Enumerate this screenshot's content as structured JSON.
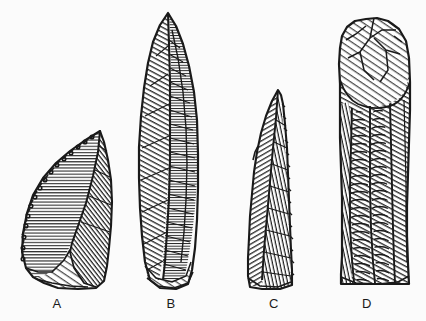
{
  "plate": {
    "title": "Stone tool plate",
    "description": "Black-and-white ink line drawing of four flaked stone artifacts shown in vertical orientation on a plain white ground, each labelled with a capital letter beneath it.",
    "background_color": "#fbfbfb",
    "ink_color": "#1a1a1a",
    "width": 426,
    "height": 321
  },
  "figures": [
    {
      "id": "a",
      "label": "A",
      "name": "backed-blade-fragment",
      "description": "Short triangular backed piece with a steeply retouched, denticulated left margin, horizontal hatching on the upper-left facet and oblique hatching on the right facet, truncated base.",
      "label_x": 55,
      "label_y": 303,
      "bounds": {
        "x": 21,
        "y": 128,
        "width": 92,
        "height": 161
      }
    },
    {
      "id": "b",
      "label": "B",
      "name": "elongated-laurel-leaf-point",
      "description": "Long leaf-shaped bifacial point with a sharp apex at the top, a central arris running the full length, and dense herringbone flake-scar hatching on both faces; broad straight base.",
      "label_x": 169,
      "label_y": 303,
      "bounds": {
        "x": 137,
        "y": 12,
        "width": 68,
        "height": 277
      }
    },
    {
      "id": "c",
      "label": "C",
      "name": "narrow-shouldered-point",
      "description": "Slender elongated point with a needle-like tip at the top, a slight shoulder on the left margin, fine parallel oblique hatching across the body and a narrow flat base.",
      "label_x": 272,
      "label_y": 303,
      "bounds": {
        "x": 246,
        "y": 88,
        "width": 48,
        "height": 201
      }
    },
    {
      "id": "d",
      "label": "D",
      "name": "prismatic-blade-core",
      "description": "Broad rectangular blade core with a rounded, heavily battered and faceted striking platform at the top; parallel blade-removal channels with concentric ripple scars down the left and straight oblique hatching on the right; flat base.",
      "label_x": 365,
      "label_y": 303,
      "bounds": {
        "x": 338,
        "y": 18,
        "width": 73,
        "height": 266
      }
    }
  ]
}
